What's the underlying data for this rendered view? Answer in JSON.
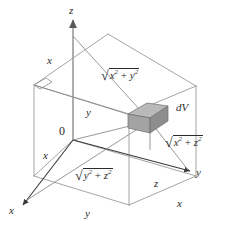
{
  "figure": {
    "type": "math-diagram",
    "width": 227,
    "height": 233,
    "background": "#ffffff",
    "line_color": "#8c8c8c",
    "dark_line_color": "#3a3a3a",
    "text_color": "#2b2b2b",
    "box_fill_top": "#b8b8b8",
    "box_fill_front": "#a0a0a0",
    "box_fill_side": "#8e8e8e"
  },
  "axes": {
    "z_label": "z",
    "y_label_right": "y",
    "x_label_left": "x",
    "origin_label": "0"
  },
  "edge_labels": {
    "x_top_left": "x",
    "y_mid": "y",
    "x_near_origin": "x",
    "y_bottom": "y",
    "z_right": "z",
    "x_bottom_right": "x"
  },
  "volume_element": {
    "label_d": "d",
    "label_v": "V",
    "label_full": "dV"
  },
  "distance_labels": [
    {
      "id": "dist-xy",
      "radical": "√",
      "body_prefix": "x",
      "exp1": "2",
      "operator": " + ",
      "body_suffix": "y",
      "exp2": "2",
      "full": "√(x² + y²)"
    },
    {
      "id": "dist-xz",
      "radical": "√",
      "body_prefix": "x",
      "exp1": "2",
      "operator": " + ",
      "body_suffix": "z",
      "exp2": "2",
      "full": "√(x² + z²)"
    },
    {
      "id": "dist-yz",
      "radical": "√",
      "body_prefix": "y",
      "exp1": "2",
      "operator": " + ",
      "body_suffix": "z",
      "exp2": "2",
      "full": "√(y² + z²)"
    }
  ]
}
